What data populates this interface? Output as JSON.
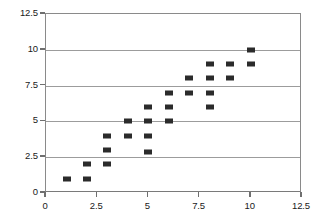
{
  "chart_data": {
    "type": "scatter",
    "title": "",
    "subtitle": "",
    "xlabel": "",
    "ylabel": "",
    "xlim": [
      0,
      12.5
    ],
    "ylim": [
      0,
      12.5
    ],
    "xticks": [
      "0",
      "2.5",
      "5",
      "7.5",
      "10",
      "12.5"
    ],
    "xtick_values": [
      0,
      2.5,
      5,
      7.5,
      10,
      12.5
    ],
    "yticks": [
      "0",
      "2.5",
      "5",
      "7.5",
      "10",
      "12.5"
    ],
    "ytick_values": [
      0,
      2.5,
      5,
      7.5,
      10,
      12.5
    ],
    "grid": "horizontal",
    "gridline_values": [
      2.5,
      5,
      7.5,
      10,
      12.5
    ],
    "legend": null,
    "marker_color": "#2b2b2b",
    "marker_shape": "square",
    "series": [
      {
        "name": "series-1",
        "points": [
          {
            "x": 1,
            "y": 1
          },
          {
            "x": 2,
            "y": 1
          },
          {
            "x": 2,
            "y": 2
          },
          {
            "x": 3,
            "y": 2
          },
          {
            "x": 3,
            "y": 3
          },
          {
            "x": 3,
            "y": 4
          },
          {
            "x": 4,
            "y": 4
          },
          {
            "x": 4,
            "y": 5
          },
          {
            "x": 5,
            "y": 2.9
          },
          {
            "x": 5,
            "y": 4
          },
          {
            "x": 5,
            "y": 5
          },
          {
            "x": 5,
            "y": 6
          },
          {
            "x": 6,
            "y": 5
          },
          {
            "x": 6,
            "y": 6
          },
          {
            "x": 6,
            "y": 7
          },
          {
            "x": 7,
            "y": 7
          },
          {
            "x": 7,
            "y": 8
          },
          {
            "x": 8,
            "y": 6
          },
          {
            "x": 8,
            "y": 7
          },
          {
            "x": 8,
            "y": 8
          },
          {
            "x": 8,
            "y": 9
          },
          {
            "x": 9,
            "y": 8
          },
          {
            "x": 9,
            "y": 9
          },
          {
            "x": 10,
            "y": 9
          },
          {
            "x": 10,
            "y": 10
          }
        ]
      }
    ]
  }
}
